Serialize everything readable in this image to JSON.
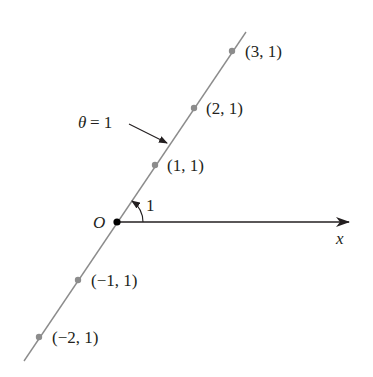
{
  "diagram": {
    "origin_label": "O",
    "axis_label": "x",
    "angle_label": "1",
    "line_label": "θ = 1",
    "line_label_theta": "θ",
    "line_label_eq": "= 1",
    "points": [
      {
        "label": "(3, 1)",
        "r": 3,
        "theta": 1
      },
      {
        "label": "(2, 1)",
        "r": 2,
        "theta": 1
      },
      {
        "label": "(1, 1)",
        "r": 1,
        "theta": 1
      },
      {
        "label": "(−1, 1)",
        "r": -1,
        "theta": 1
      },
      {
        "label": "(−2, 1)",
        "r": -2,
        "theta": 1
      }
    ],
    "colors": {
      "line": "#8c8c8c",
      "point": "#8c8c8c",
      "axis": "#231f20",
      "text": "#231f20"
    }
  }
}
